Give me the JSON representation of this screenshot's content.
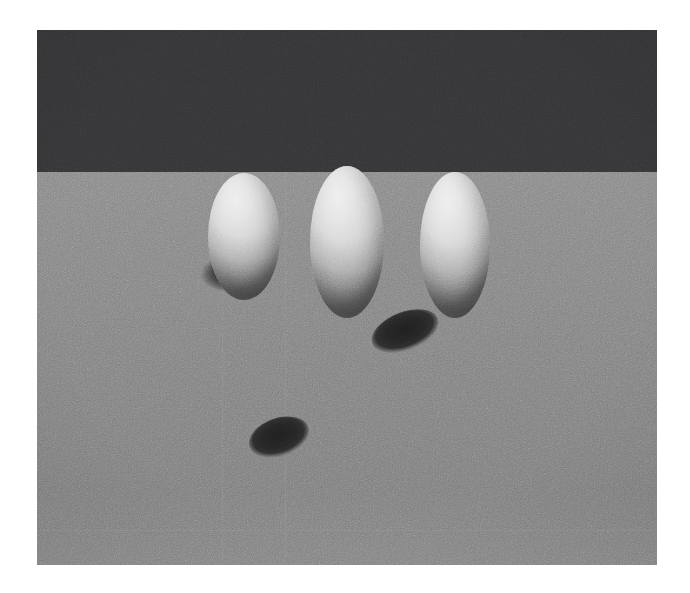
{
  "canvas": {
    "width": 690,
    "height": 593,
    "page_background": "#ffffff"
  },
  "scene": {
    "name": "rendered-3d-scene",
    "left": 37,
    "top": 30,
    "width": 620,
    "height": 535,
    "description": "Three white ellipsoids above a gray ground plane with a dark backdrop; two detached elliptical cast shadows lie on the ground.",
    "backdrop": {
      "label": "dark backdrop",
      "color": "#343436",
      "height": 142
    },
    "ground": {
      "label": "ground plane",
      "color": "#808080",
      "horizon_y": 142
    },
    "noise": {
      "label": "film grain",
      "opacity": 0.5
    }
  },
  "objects": {
    "ellipsoids": [
      {
        "id": "ellipsoid-1",
        "label": "left ellipsoid",
        "left": 171,
        "top": 143,
        "width": 72,
        "height": 127,
        "fill": "#ddddddd",
        "highlight": "#ededed",
        "has_contact_shadow": true
      },
      {
        "id": "ellipsoid-2",
        "label": "center ellipsoid",
        "left": 273,
        "top": 136,
        "width": 74,
        "height": 152,
        "fill": "#dddddd",
        "highlight": "#ededed",
        "has_contact_shadow": false
      },
      {
        "id": "ellipsoid-3",
        "label": "right ellipsoid",
        "left": 383,
        "top": 142,
        "width": 70,
        "height": 146,
        "fill": "#dddddd",
        "highlight": "#ededed",
        "has_contact_shadow": false
      }
    ],
    "contact_shadow": {
      "id": "contact-shadow-1",
      "label": "contact shadow under left ellipsoid",
      "left": 163,
      "top": 222,
      "width": 72,
      "height": 40,
      "rotation_deg": -6,
      "color": "#222222"
    },
    "cast_shadows": [
      {
        "id": "cast-shadow-upper",
        "label": "upper-right detached cast shadow",
        "left": 333,
        "top": 282,
        "width": 70,
        "height": 38,
        "rotation_deg": -21,
        "color": "#222222"
      },
      {
        "id": "cast-shadow-lower",
        "label": "lower-left detached cast shadow",
        "left": 211,
        "top": 388,
        "width": 62,
        "height": 38,
        "rotation_deg": -19,
        "color": "#222222"
      }
    ]
  },
  "palette": {
    "page": "#ffffff",
    "backdrop": "#343436",
    "ground": "#808080",
    "object_light": "#ededed",
    "object_mid": "#c6c6c6",
    "object_dark": "#8d8d8d",
    "shadow": "#222222"
  }
}
